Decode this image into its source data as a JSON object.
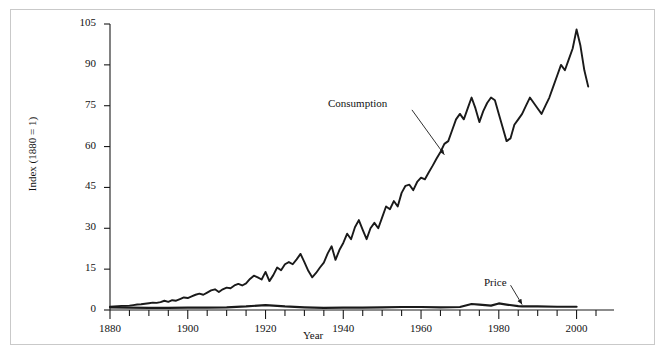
{
  "figure": {
    "background": "#ffffff",
    "frame_color": "#c9c9c9",
    "line_color": "#1a1a1a"
  },
  "chart_data": {
    "type": "line",
    "title": "",
    "xlabel": "Year",
    "ylabel": "Index (1880 = 1)",
    "xlim": [
      1880,
      2005
    ],
    "ylim": [
      0,
      105
    ],
    "grid": false,
    "legend": "annotations-on-plot",
    "xticks": [
      1880,
      1900,
      1920,
      1940,
      1960,
      1980,
      2000
    ],
    "xtick_labels": [
      "1880",
      "1900",
      "1920",
      "1940",
      "1960",
      "1980",
      "2000"
    ],
    "minor_xtick_interval": 5,
    "yticks": [
      0,
      15,
      30,
      45,
      60,
      75,
      90,
      105
    ],
    "ytick_labels": [
      "0",
      "15",
      "30",
      "45",
      "60",
      "75",
      "90",
      "105"
    ],
    "annotations": [
      {
        "text": "Consumption",
        "x": 1952,
        "y": 72,
        "arrow_to_x": 1966,
        "arrow_to_y": 57
      },
      {
        "text": "Price",
        "x": 1982,
        "y": 8,
        "arrow_to_x": 1986,
        "arrow_to_y": 2
      }
    ],
    "series": [
      {
        "name": "Consumption",
        "x": [
          1880,
          1881,
          1882,
          1883,
          1884,
          1885,
          1886,
          1887,
          1888,
          1889,
          1890,
          1891,
          1892,
          1893,
          1894,
          1895,
          1896,
          1897,
          1898,
          1899,
          1900,
          1901,
          1902,
          1903,
          1904,
          1905,
          1906,
          1907,
          1908,
          1909,
          1910,
          1911,
          1912,
          1913,
          1914,
          1915,
          1916,
          1917,
          1918,
          1919,
          1920,
          1921,
          1922,
          1923,
          1924,
          1925,
          1926,
          1927,
          1928,
          1929,
          1930,
          1931,
          1932,
          1933,
          1934,
          1935,
          1936,
          1937,
          1938,
          1939,
          1940,
          1941,
          1942,
          1943,
          1944,
          1945,
          1946,
          1947,
          1948,
          1949,
          1950,
          1951,
          1952,
          1953,
          1954,
          1955,
          1956,
          1957,
          1958,
          1959,
          1960,
          1961,
          1962,
          1963,
          1964,
          1965,
          1966,
          1967,
          1968,
          1969,
          1970,
          1971,
          1972,
          1973,
          1974,
          1975,
          1976,
          1977,
          1978,
          1979,
          1980,
          1981,
          1982,
          1983,
          1984,
          1985,
          1986,
          1987,
          1988,
          1989,
          1990,
          1991,
          1992,
          1993,
          1994,
          1995,
          1996,
          1997,
          1998,
          1999,
          2000,
          2001,
          2002,
          2003
        ],
        "y": [
          1.2,
          1.3,
          1.4,
          1.5,
          1.5,
          1.6,
          1.8,
          2.0,
          2.1,
          2.3,
          2.5,
          2.7,
          2.6,
          2.9,
          3.4,
          3.0,
          3.6,
          3.4,
          4.0,
          4.6,
          4.4,
          5.0,
          5.6,
          6.0,
          5.6,
          6.4,
          7.2,
          7.6,
          6.6,
          7.6,
          8.2,
          8.0,
          9.0,
          9.6,
          9.0,
          9.8,
          11.4,
          12.6,
          12.0,
          11.2,
          14.0,
          10.6,
          12.8,
          15.6,
          14.6,
          16.8,
          17.6,
          16.8,
          18.6,
          20.6,
          17.6,
          14.4,
          12.0,
          13.6,
          15.6,
          17.4,
          20.8,
          23.4,
          18.4,
          22.0,
          24.6,
          28.0,
          26.0,
          30.4,
          33.0,
          29.4,
          26.0,
          30.0,
          32.0,
          30.0,
          34.0,
          38.0,
          37.0,
          40.0,
          38.0,
          43.0,
          45.6,
          46.0,
          44.0,
          47.0,
          48.6,
          48.0,
          50.6,
          53.0,
          55.6,
          58.0,
          61.0,
          62.0,
          66.0,
          70.0,
          72.0,
          70.0,
          74.0,
          78.0,
          74.0,
          69.0,
          73.0,
          76.0,
          78.0,
          77.0,
          72.0,
          67.0,
          62.0,
          63.0,
          68.0,
          70.0,
          72.0,
          75.0,
          78.0,
          76.0,
          74.0,
          72.0,
          75.0,
          78.0,
          82.0,
          86.0,
          90.0,
          88.0,
          92.0,
          96.0,
          103.0,
          97.0,
          88.0,
          82.0
        ]
      },
      {
        "name": "Price",
        "x": [
          1880,
          1885,
          1890,
          1895,
          1900,
          1905,
          1910,
          1915,
          1920,
          1925,
          1930,
          1935,
          1940,
          1945,
          1950,
          1955,
          1960,
          1965,
          1970,
          1973,
          1975,
          1978,
          1980,
          1982,
          1985,
          1986,
          1990,
          1995,
          2000
        ],
        "y": [
          1.0,
          0.9,
          0.8,
          0.8,
          0.9,
          0.9,
          1.0,
          1.3,
          1.8,
          1.3,
          1.0,
          0.8,
          0.9,
          0.9,
          1.0,
          1.1,
          1.1,
          1.0,
          1.1,
          2.2,
          2.0,
          1.6,
          2.4,
          2.0,
          1.4,
          1.3,
          1.3,
          1.2,
          1.2
        ]
      }
    ]
  }
}
